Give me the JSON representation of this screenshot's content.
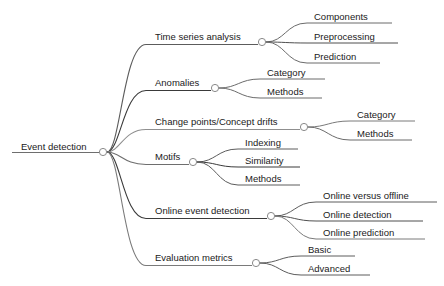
{
  "diagram": {
    "type": "mindmap",
    "title": "Event detection",
    "background_color": "#ffffff",
    "text_color": "#1a1a1a",
    "node_circle_fill": "#ffffff",
    "node_circle_stroke": "#8a8a8a",
    "root": {
      "label": "Event detection",
      "x": 103,
      "y": 152,
      "underline_x1": 12,
      "underline_x2": 99,
      "text_x": 21,
      "text_y": 150,
      "underline_color": "#6e6e6e"
    },
    "branches": [
      {
        "label": "Time series analysis",
        "color": "#5c5c5c",
        "node_x": 262,
        "node_y": 42,
        "underline_x1": 146,
        "underline_x2": 258,
        "text_x": 155,
        "text_y": 40,
        "children": [
          {
            "label": "Components",
            "color": "#6b6b6b",
            "underline_x1": 307,
            "underline_x2": 392,
            "text_x": 314,
            "text_y": 20,
            "underline_y": 23
          },
          {
            "label": "Preprocessing",
            "color": "#4f4f4f",
            "underline_x1": 307,
            "underline_x2": 398,
            "text_x": 314,
            "text_y": 40,
            "underline_y": 43
          },
          {
            "label": "Prediction",
            "color": "#6b6b6b",
            "underline_x1": 307,
            "underline_x2": 380,
            "text_x": 314,
            "text_y": 60,
            "underline_y": 63
          }
        ]
      },
      {
        "label": "Anomalies",
        "color": "#3a3a3a",
        "node_x": 215,
        "node_y": 88,
        "underline_x1": 146,
        "underline_x2": 211,
        "text_x": 155,
        "text_y": 86,
        "children": [
          {
            "label": "Category",
            "color": "#6b6b6b",
            "underline_x1": 260,
            "underline_x2": 325,
            "text_x": 267,
            "text_y": 76,
            "underline_y": 79
          },
          {
            "label": "Methods",
            "color": "#6b6b6b",
            "underline_x1": 260,
            "underline_x2": 322,
            "text_x": 267,
            "text_y": 95,
            "underline_y": 98
          }
        ]
      },
      {
        "label": "Change points/Concept drifts",
        "color": "#8f8f8f",
        "node_x": 304,
        "node_y": 127,
        "underline_x1": 146,
        "underline_x2": 300,
        "text_x": 155,
        "text_y": 125,
        "children": [
          {
            "label": "Category",
            "color": "#7a7a7a",
            "underline_x1": 350,
            "underline_x2": 415,
            "text_x": 357,
            "text_y": 118,
            "underline_y": 121
          },
          {
            "label": "Methods",
            "color": "#6b6b6b",
            "underline_x1": 350,
            "underline_x2": 412,
            "text_x": 357,
            "text_y": 137,
            "underline_y": 140
          }
        ]
      },
      {
        "label": "Motifs",
        "color": "#6e6e6e",
        "node_x": 193,
        "node_y": 162,
        "underline_x1": 146,
        "underline_x2": 189,
        "text_x": 155,
        "text_y": 160,
        "children": [
          {
            "label": "Indexing",
            "color": "#5c5c5c",
            "underline_x1": 238,
            "underline_x2": 298,
            "text_x": 245,
            "text_y": 146,
            "underline_y": 149
          },
          {
            "label": "Similarity",
            "color": "#3a3a3a",
            "underline_x1": 238,
            "underline_x2": 300,
            "text_x": 245,
            "text_y": 164,
            "underline_y": 167
          },
          {
            "label": "Methods",
            "color": "#5c5c5c",
            "underline_x1": 238,
            "underline_x2": 300,
            "text_x": 245,
            "text_y": 182,
            "underline_y": 185
          }
        ]
      },
      {
        "label": "Online event detection",
        "color": "#3a3a3a",
        "node_x": 271,
        "node_y": 216,
        "underline_x1": 146,
        "underline_x2": 267,
        "text_x": 155,
        "text_y": 214,
        "children": [
          {
            "label": "Online versus offline",
            "color": "#5c5c5c",
            "underline_x1": 316,
            "underline_x2": 437,
            "text_x": 323,
            "text_y": 199,
            "underline_y": 202
          },
          {
            "label": "Online detection",
            "color": "#4f4f4f",
            "underline_x1": 316,
            "underline_x2": 423,
            "text_x": 323,
            "text_y": 218,
            "underline_y": 221
          },
          {
            "label": "Online prediction",
            "color": "#7a7a7a",
            "underline_x1": 316,
            "underline_x2": 425,
            "text_x": 323,
            "text_y": 236,
            "underline_y": 239
          }
        ]
      },
      {
        "label": "Evaluation metrics",
        "color": "#7a7a7a",
        "node_x": 256,
        "node_y": 263,
        "underline_x1": 146,
        "underline_x2": 252,
        "text_x": 155,
        "text_y": 261,
        "children": [
          {
            "label": "Basic",
            "color": "#5c5c5c",
            "underline_x1": 301,
            "underline_x2": 355,
            "text_x": 308,
            "text_y": 253,
            "underline_y": 256
          },
          {
            "label": "Advanced",
            "color": "#5c5c5c",
            "underline_x1": 301,
            "underline_x2": 370,
            "text_x": 308,
            "text_y": 272,
            "underline_y": 275
          }
        ]
      }
    ]
  }
}
